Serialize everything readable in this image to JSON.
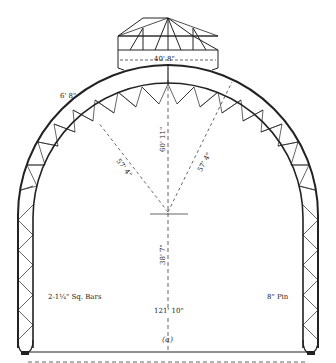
{
  "diagram": {
    "type": "three-hinged arch truss elevation",
    "caption": "(a)",
    "labels": {
      "lantern_span": "40' 8\"",
      "truss_depth": "6' 8\"",
      "rise": "60' 11\"",
      "radius_left": "57' 4\"",
      "radius_right": "57' 4\"",
      "spring_height": "38' 7\"",
      "tie_bars": "2-1¼\" Sq. Bars",
      "pin": "8\" Pin",
      "total_span": "121' 10\""
    },
    "colors": {
      "line": "#222222",
      "background": "#ffffff"
    }
  }
}
